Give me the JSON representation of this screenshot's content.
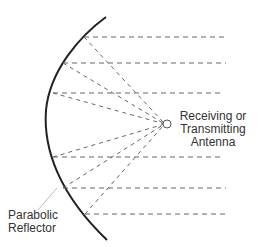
{
  "diagram": {
    "labels": {
      "antenna": [
        "Receiving or",
        "Transmitting",
        "Antenna"
      ],
      "reflector": [
        "Parabolic",
        "Reflector"
      ]
    },
    "colors": {
      "reflector_stroke": "#222222",
      "ray_stroke": "#666666",
      "leader_stroke": "#bbbbbb",
      "text": "#333333",
      "background": "#ffffff"
    },
    "geometry": {
      "antenna_focus": {
        "x": 167,
        "y": 124,
        "r": 4
      },
      "reflector_points": [
        [
          106,
          17
        ],
        [
          83,
          37
        ],
        [
          62,
          63
        ],
        [
          52,
          93
        ],
        [
          45,
          125
        ],
        [
          52,
          155
        ],
        [
          62,
          187
        ],
        [
          83,
          215
        ],
        [
          107,
          240
        ]
      ],
      "parallel_rays_y": [
        37,
        63,
        93,
        155,
        187,
        215
      ],
      "ray_end_x": 226
    }
  }
}
